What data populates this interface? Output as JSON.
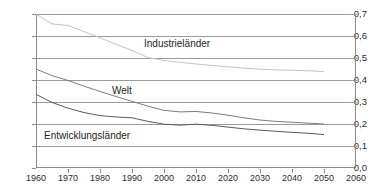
{
  "chart_data": {
    "type": "line",
    "title": "",
    "xlabel": "",
    "ylabel": "",
    "xlim": [
      1960,
      2060
    ],
    "ylim": [
      0.0,
      0.7
    ],
    "grid": true,
    "legend_position": "inline-annotations",
    "x_ticks": [
      "1960",
      "1970",
      "1980",
      "1990",
      "2000",
      "2010",
      "2020",
      "2030",
      "2040",
      "2050",
      "2060"
    ],
    "y_ticks": [
      "0,0",
      "0,1",
      "0,2",
      "0,3",
      "0,4",
      "0,5",
      "0,6",
      "0,7"
    ],
    "x": [
      1960,
      1965,
      1970,
      1975,
      1980,
      1985,
      1990,
      1995,
      2000,
      2005,
      2010,
      2015,
      2020,
      2025,
      2030,
      2035,
      2040,
      2045,
      2050
    ],
    "series": [
      {
        "name": "Industrieländer",
        "color": "#c4c4c4",
        "values": [
          0.7,
          0.655,
          0.648,
          0.62,
          0.592,
          0.562,
          0.535,
          0.502,
          0.489,
          0.48,
          0.473,
          0.466,
          0.46,
          0.454,
          0.449,
          0.446,
          0.444,
          0.442,
          0.438
        ]
      },
      {
        "name": "Welt",
        "color": "#7d7d7d",
        "values": [
          0.45,
          0.42,
          0.398,
          0.372,
          0.348,
          0.325,
          0.303,
          0.281,
          0.262,
          0.255,
          0.257,
          0.25,
          0.24,
          0.228,
          0.218,
          0.212,
          0.208,
          0.204,
          0.2
        ]
      },
      {
        "name": "Entwicklungsländer",
        "color": "#5a5a5a",
        "values": [
          0.335,
          0.298,
          0.272,
          0.252,
          0.238,
          0.232,
          0.228,
          0.212,
          0.199,
          0.195,
          0.199,
          0.194,
          0.186,
          0.178,
          0.172,
          0.167,
          0.162,
          0.158,
          0.152
        ]
      }
    ],
    "annotations": [
      {
        "text": "Industrieländer",
        "x_px": 144,
        "y_px": 39
      },
      {
        "text": "Welt",
        "x_px": 112,
        "y_px": 86
      },
      {
        "text": "Entwicklungsländer",
        "x_px": 44,
        "y_px": 131
      }
    ]
  }
}
